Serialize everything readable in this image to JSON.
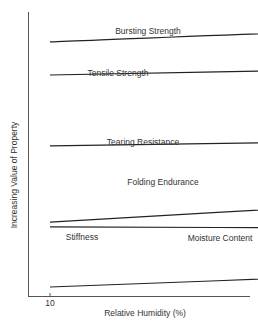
{
  "chart_data": {
    "type": "line",
    "title": "",
    "xlabel": "Relative Humidity (%)",
    "ylabel": "Increasing Value of Property",
    "xlim": [
      3,
      85
    ],
    "ylim": [
      0,
      100
    ],
    "x_ticks": [
      10,
      20,
      30,
      40,
      50,
      60,
      70,
      80
    ],
    "y_ticks": [],
    "grid": false,
    "legend": "none (curves labeled inline)",
    "colors": {
      "line": "#222222",
      "axis": "#555555",
      "text": "#333333"
    },
    "series": [
      {
        "name": "Bursting Strength",
        "x": [
          10,
          20,
          30,
          40,
          50,
          60,
          70,
          77
        ],
        "values": [
          89.5,
          93,
          94.7,
          96,
          96,
          95.4,
          92.3,
          88
        ],
        "label_pos": [
          148,
          34
        ]
      },
      {
        "name": "Tensile Strength",
        "x": [
          10,
          20,
          30,
          40,
          50,
          60,
          70,
          77
        ],
        "values": [
          77.9,
          79.6,
          81,
          81,
          80.4,
          78.2,
          74.4,
          70.9
        ],
        "label_pos": [
          118,
          76
        ]
      },
      {
        "name": "Tearing Resistance",
        "x": [
          10,
          62
        ],
        "values": [
          53,
          60.4
        ],
        "label_pos": [
          143,
          145
        ]
      },
      {
        "name": "Folding Endurance",
        "x": [
          10,
          20,
          30,
          40,
          50,
          60,
          70,
          77
        ],
        "values": [
          26.3,
          31.6,
          36.5,
          41,
          44.6,
          47,
          48.8,
          49.1
        ],
        "label_pos": [
          163,
          185
        ]
      },
      {
        "name": "Stiffness",
        "x": [
          10,
          20,
          30,
          40,
          50,
          60,
          70,
          78
        ],
        "values": [
          24.6,
          24.2,
          23.2,
          21.4,
          19.6,
          16.8,
          14.4,
          11.9
        ],
        "label_pos": [
          82,
          240
        ]
      },
      {
        "name": "Moisture Content",
        "x": [
          10,
          20,
          30,
          40,
          50,
          60,
          70,
          78
        ],
        "values": [
          3.5,
          7,
          10.5,
          14,
          17.9,
          21.4,
          24.6,
          27
        ],
        "label_pos": [
          220,
          241
        ]
      }
    ],
    "annotations": [
      "Stiffness and Moisture Content curves cross near 52% RH"
    ]
  }
}
